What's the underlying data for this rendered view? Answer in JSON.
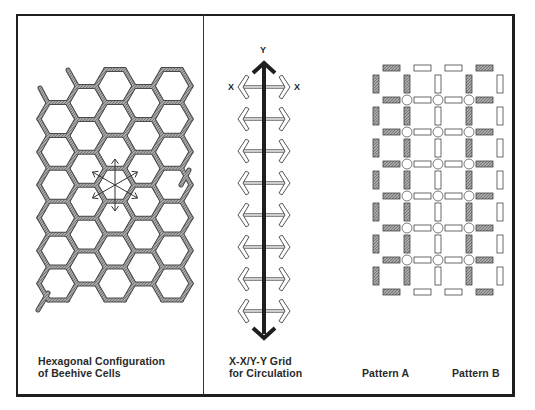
{
  "panels": {
    "hexagon": {
      "caption_line1": "Hexagonal Configuration",
      "caption_line2": "of Beehive Cells"
    },
    "circulation": {
      "caption_line1": "X-X/Y-Y Grid",
      "caption_line2": "for Circulation",
      "y_label": "Y",
      "x_label_left": "X",
      "x_label_right": "X",
      "horizontal_arrow_count": 8
    },
    "patterns": {
      "pattern_a_label": "Pattern A",
      "pattern_b_label": "Pattern B",
      "grid_rows": 7,
      "grid_columns": 4
    }
  },
  "colors": {
    "border": "#1e1e1e",
    "cell_wall_fill": "#9a9a9a",
    "cell_wall_stroke": "#4a4a4a",
    "text": "#2a2a2a"
  }
}
